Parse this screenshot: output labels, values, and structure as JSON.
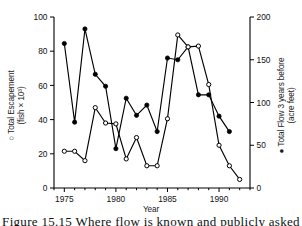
{
  "figure": {
    "caption_partial": "Figure 15.15  Where flow is known and publicly asked",
    "background_color": "#ffffff",
    "ink_color": "#000000"
  },
  "axes": {
    "x": {
      "label": "Year",
      "ticks": [
        1975,
        1980,
        1985,
        1990
      ],
      "tick_labels": [
        "1975",
        "1980",
        "1985",
        "1990"
      ],
      "range": [
        1974,
        1993
      ],
      "minor_ticks": [
        1974,
        1975,
        1976,
        1977,
        1978,
        1979,
        1980,
        1981,
        1982,
        1983,
        1984,
        1985,
        1986,
        1987,
        1988,
        1989,
        1990,
        1991,
        1992,
        1993
      ]
    },
    "left": {
      "label_line1": "○ Total Escapement",
      "label_line2": "(fish × 10³)",
      "marker": "open-circle",
      "ticks": [
        0,
        20,
        40,
        60,
        80,
        100
      ],
      "tick_labels": [
        "0",
        "20",
        "40",
        "60",
        "80",
        "100"
      ],
      "range": [
        0,
        100
      ]
    },
    "right": {
      "label_line1": "● Total Flow 3 years before",
      "label_line2": "(acre feet)",
      "marker": "filled-circle",
      "ticks": [
        0,
        50,
        100,
        150,
        200
      ],
      "tick_labels": [
        "0",
        "50",
        "100",
        "150",
        "200"
      ],
      "range": [
        0,
        200
      ]
    }
  },
  "chart_data": {
    "type": "line",
    "title": "",
    "xlabel": "Year",
    "ylabel": "Total Escapement (fish x 10^3)",
    "y2label": "Total Flow 3 years before (acre feet)",
    "xlim": [
      1974,
      1993
    ],
    "ylim": [
      0,
      100
    ],
    "y2lim": [
      0,
      200
    ],
    "grid": false,
    "legend": "inline-axis-labels",
    "x": [
      1975,
      1976,
      1977,
      1978,
      1979,
      1980,
      1981,
      1982,
      1983,
      1984,
      1985,
      1986,
      1987,
      1988,
      1989,
      1990,
      1991,
      1992
    ],
    "series": [
      {
        "name": "Total Escapement",
        "marker": "open-circle",
        "axis": "left",
        "units": "fish x 10^3",
        "x": [
          1975,
          1976,
          1977,
          1978,
          1979,
          1980,
          1981,
          1982,
          1983,
          1984,
          1985,
          1986,
          1987,
          1988,
          1989,
          1990,
          1991,
          1992
        ],
        "values": [
          21.5,
          21.5,
          16.0,
          47.0,
          38.0,
          37.5,
          17.0,
          29.5,
          13.0,
          13.0,
          40.5,
          89.5,
          82.5,
          83.0,
          60.5,
          25.0,
          13.0,
          5.0
        ]
      },
      {
        "name": "Total Flow 3 years before",
        "marker": "filled-circle",
        "axis": "right",
        "units": "acre feet",
        "x": [
          1975,
          1976,
          1977,
          1978,
          1979,
          1980,
          1981,
          1982,
          1983,
          1984,
          1985,
          1986,
          1987,
          1988,
          1989,
          1990,
          1991
        ],
        "values": [
          169,
          77,
          186,
          133,
          119,
          46,
          105,
          85,
          97,
          66,
          152,
          150,
          165,
          109,
          109,
          84,
          66
        ],
        "values_left_scale": [
          84.5,
          38.5,
          93.0,
          66.5,
          59.5,
          23.0,
          52.5,
          42.5,
          48.5,
          33.0,
          76.0,
          75.0,
          82.5,
          54.5,
          54.5,
          42.0,
          33.0
        ]
      }
    ]
  }
}
